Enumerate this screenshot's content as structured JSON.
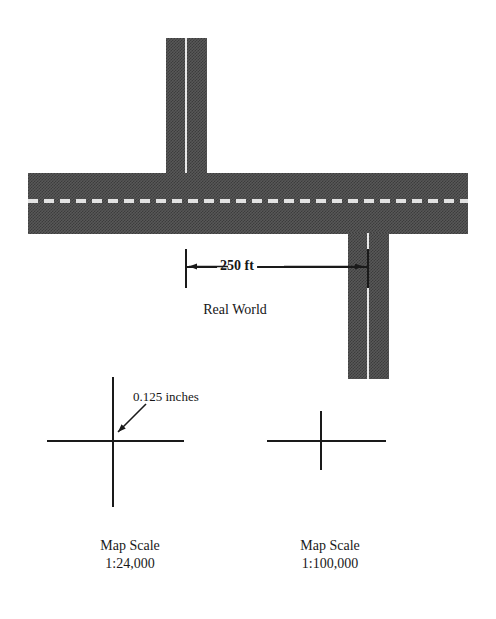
{
  "figure": {
    "colors": {
      "asphalt_dark": "#3c3c3c",
      "asphalt_light": "#585858",
      "centerline": "#e8e8e8",
      "ink": "#1a1a1a",
      "background": "#ffffff"
    }
  },
  "real_world": {
    "section_label": "Real World",
    "dimension_label": "250 ft",
    "roads": [
      {
        "name": "north-leg",
        "orientation": "vertical"
      },
      {
        "name": "main-highway",
        "orientation": "horizontal"
      },
      {
        "name": "south-leg",
        "orientation": "vertical"
      }
    ]
  },
  "callout": {
    "text": "0.125 inches"
  },
  "map_panels": [
    {
      "name": "large-scale",
      "title": "Map Scale",
      "ratio": "1:24,000"
    },
    {
      "name": "small-scale",
      "title": "Map Scale",
      "ratio": "1:100,000"
    }
  ]
}
